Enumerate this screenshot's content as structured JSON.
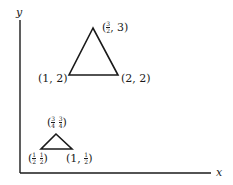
{
  "axes": {
    "x_label": "x",
    "y_label": "y",
    "color": "#1a1a1a"
  },
  "large_triangle": {
    "vertices": [
      {
        "name": "apex",
        "label_prefix": "(",
        "frac_num": "3",
        "frac_den": "2",
        "label_suffix": ", 3)"
      },
      {
        "name": "left",
        "label": "(1, 2)"
      },
      {
        "name": "right",
        "label": "(2, 2)"
      }
    ]
  },
  "small_triangle": {
    "vertices": [
      {
        "name": "apex",
        "x_num": "3",
        "x_den": "4",
        "y_num": "3",
        "y_den": "4"
      },
      {
        "name": "left",
        "x_num": "1",
        "x_den": "2",
        "y_num": "1",
        "y_den": "2"
      },
      {
        "name": "right",
        "label_prefix": "(1, ",
        "frac_num": "1",
        "frac_den": "2",
        "label_suffix": ")"
      }
    ]
  }
}
